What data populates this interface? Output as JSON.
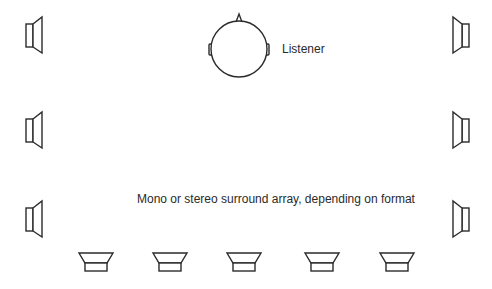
{
  "diagram": {
    "labels": {
      "listener": "Listener",
      "array": "Mono or stereo surround array, depending on format"
    },
    "colors": {
      "background": "#ffffff",
      "stroke": "#2b2b2b",
      "text": "#2a2a2a"
    },
    "listener": {
      "cx": 239,
      "cy": 49,
      "r": 28
    },
    "speakers": {
      "left": [
        {
          "id": "left-1",
          "y": 35
        },
        {
          "id": "left-2",
          "y": 130
        },
        {
          "id": "left-3",
          "y": 219
        }
      ],
      "right": [
        {
          "id": "right-1",
          "y": 35
        },
        {
          "id": "right-2",
          "y": 130
        },
        {
          "id": "right-3",
          "y": 219
        }
      ],
      "rear": [
        {
          "id": "rear-1",
          "x": 96
        },
        {
          "id": "rear-2",
          "x": 170
        },
        {
          "id": "rear-3",
          "x": 244
        },
        {
          "id": "rear-4",
          "x": 322
        },
        {
          "id": "rear-5",
          "x": 397
        }
      ]
    }
  }
}
